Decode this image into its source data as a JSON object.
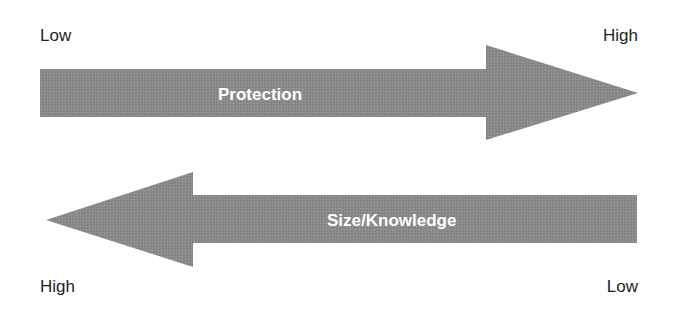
{
  "colors": {
    "arrow_fill": "#8a8a8a",
    "arrow_text": "#ffffff",
    "label_text": "#1e1e1e"
  },
  "top_arrow": {
    "direction": "right",
    "label": "Protection",
    "start_label": "Low",
    "end_label": "High"
  },
  "bottom_arrow": {
    "direction": "left",
    "label": "Size/Knowledge",
    "start_label": "Low",
    "end_label": "High"
  }
}
